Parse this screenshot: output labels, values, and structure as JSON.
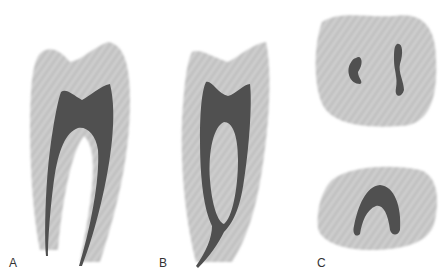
{
  "figure": {
    "panels": [
      {
        "label": "A",
        "description": "Tooth longitudinal section with two root canals diverging from pulp chamber"
      },
      {
        "label": "B",
        "description": "Tooth longitudinal section with two canals merging into a single apical foramen"
      },
      {
        "label": "C",
        "description": "Cross sections: upper with two separate canals, lower with single C-shaped canal"
      }
    ],
    "colors": {
      "dentin": "#c8c8c8",
      "pulp": "#555555",
      "background": "#ffffff"
    }
  }
}
